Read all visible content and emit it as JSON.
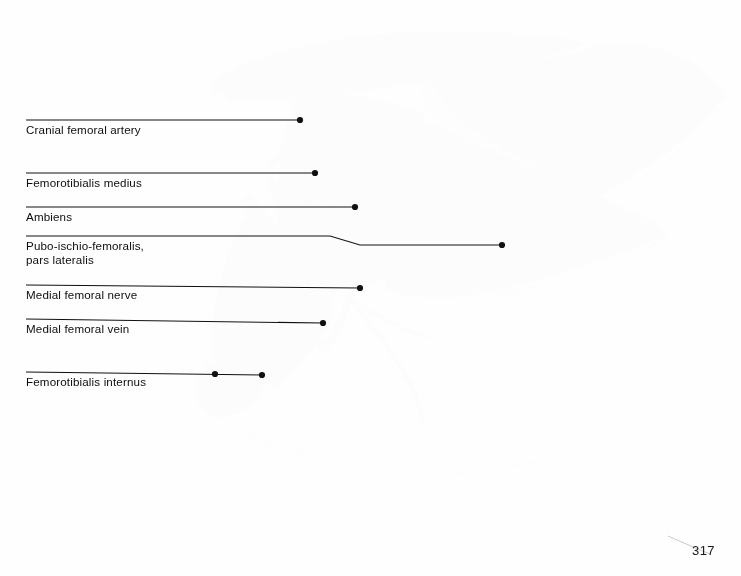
{
  "page": {
    "folio": "317",
    "caption_fragment": "",
    "background_color": "#fefefe",
    "ink_color": "#111111"
  },
  "figure": {
    "name": "hindlimb-musculature-lateral-view",
    "medium": "pencil drawing",
    "pelvis_fenestrae": [
      "acetabulum",
      "ilioischiadic fenestra"
    ],
    "muscle_tone_colors": {
      "mid_gray": "#8a8a8a",
      "dark_gray": "#6e6e6e",
      "light_gray": "#aeaeae",
      "striation": "#f2f2f2",
      "outline": "#4a4a4a"
    }
  },
  "labels": [
    {
      "id": "cranial-femoral-artery",
      "text": "Cranial femoral artery",
      "lines": 1,
      "leader_y": 120,
      "text_y": 123,
      "leader_x1": 26,
      "leader_x2": 300,
      "dots": [
        [
          300,
          120
        ]
      ]
    },
    {
      "id": "femorotibialis-medius",
      "text": "Femorotibialis medius",
      "lines": 1,
      "leader_y": 173,
      "text_y": 176,
      "leader_x1": 26,
      "leader_x2": 315,
      "dots": [
        [
          315,
          173
        ]
      ]
    },
    {
      "id": "ambiens",
      "text": "Ambiens",
      "lines": 1,
      "leader_y": 207,
      "text_y": 210,
      "leader_x1": 26,
      "leader_x2": 355,
      "dots": [
        [
          355,
          207
        ]
      ]
    },
    {
      "id": "pubo-ischio-femoralis-pars-lateralis",
      "text": "Pubo-ischio-femoralis,\npars lateralis",
      "lines": 2,
      "leader_y": 236,
      "text_y": 239,
      "leader_x1": 26,
      "leader_x2": 502,
      "dots": [
        [
          502,
          245
        ]
      ]
    },
    {
      "id": "medial-femoral-nerve",
      "text": "Medial femoral nerve",
      "lines": 1,
      "leader_y": 285,
      "text_y": 288,
      "leader_x1": 26,
      "leader_x2": 360,
      "dots": [
        [
          360,
          288
        ]
      ]
    },
    {
      "id": "medial-femoral-vein",
      "text": "Medial femoral vein",
      "lines": 1,
      "leader_y": 319,
      "text_y": 322,
      "leader_x1": 26,
      "leader_x2": 323,
      "dots": [
        [
          323,
          323
        ]
      ]
    },
    {
      "id": "femorotibialis-internus",
      "text": "Femorotibialis internus",
      "lines": 1,
      "leader_y": 372,
      "text_y": 375,
      "leader_x1": 26,
      "leader_x2": 262,
      "dots": [
        [
          215,
          375
        ],
        [
          262,
          375
        ]
      ]
    }
  ]
}
